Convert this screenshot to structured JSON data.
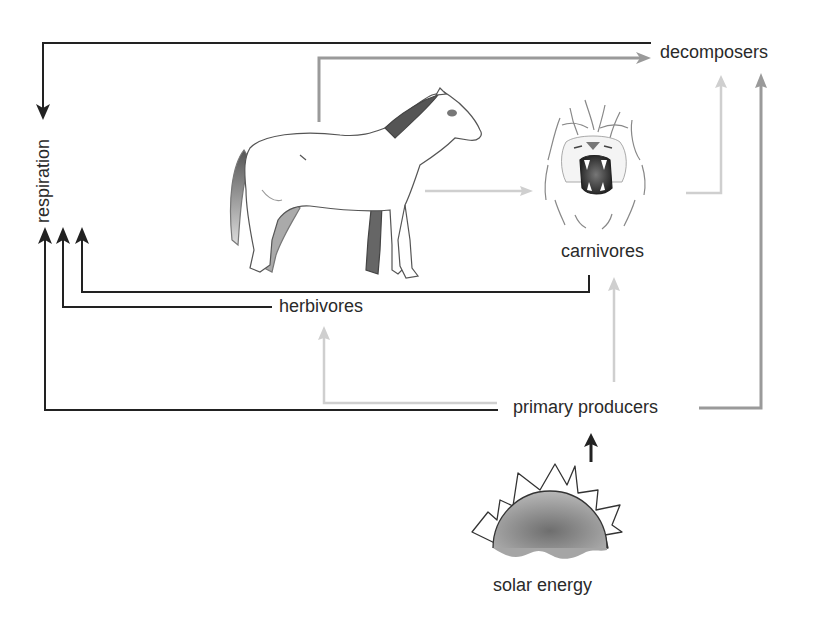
{
  "diagram": {
    "type": "energy-flow",
    "nodes": {
      "respiration": {
        "label": "respiration"
      },
      "decomposers": {
        "label": "decomposers"
      },
      "herbivores": {
        "label": "herbivores",
        "illustration": "horse"
      },
      "carnivores": {
        "label": "carnivores",
        "illustration": "lion-head"
      },
      "primary_producers": {
        "label": "primary producers"
      },
      "solar_energy": {
        "label": "solar energy",
        "illustration": "rising-sun"
      }
    },
    "edges": [
      {
        "from": "decomposers",
        "to": "respiration",
        "style": "black"
      },
      {
        "from": "herbivores",
        "to": "respiration",
        "style": "black"
      },
      {
        "from": "carnivores",
        "to": "respiration",
        "style": "black"
      },
      {
        "from": "primary_producers",
        "to": "respiration",
        "style": "black"
      },
      {
        "from": "herbivores",
        "to": "decomposers",
        "style": "gray"
      },
      {
        "from": "herbivores",
        "to": "carnivores",
        "style": "light-gray"
      },
      {
        "from": "carnivores",
        "to": "decomposers",
        "style": "light-gray"
      },
      {
        "from": "primary_producers",
        "to": "herbivores",
        "style": "light-gray"
      },
      {
        "from": "primary_producers",
        "to": "carnivores",
        "style": "light-gray"
      },
      {
        "from": "primary_producers",
        "to": "decomposers",
        "style": "gray"
      },
      {
        "from": "solar_energy",
        "to": "primary_producers",
        "style": "black"
      }
    ],
    "colors": {
      "black": "#222222",
      "gray": "#9a9a9a",
      "light_gray": "#cfcfcf",
      "text": "#2a2a2a",
      "sun_fill": "#8f8f8f"
    }
  }
}
